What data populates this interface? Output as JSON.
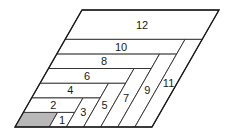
{
  "diagram": {
    "type": "nested-L parallelogram tiling",
    "geometry": {
      "origin_x": 15,
      "origin_y": 127,
      "col_width": 17.125,
      "row_height": 14.625,
      "shear": 0.5726,
      "cols": 8,
      "rows": 8
    },
    "colors": {
      "shaded": "#b8b8b8",
      "stroke": "#2a2a2a",
      "background": "#ffffff"
    },
    "shaded_cell": {
      "c0": 0,
      "c1": 2,
      "r0": 0,
      "r1": 1
    },
    "pieces": [
      {
        "label": "1",
        "c0": 2,
        "c1": 3,
        "r0": 0,
        "r1": 1
      },
      {
        "label": "2",
        "c0": 0,
        "c1": 3,
        "r0": 1,
        "r1": 2
      },
      {
        "label": "3",
        "c0": 3,
        "c1": 4,
        "r0": 0,
        "r1": 2
      },
      {
        "label": "4",
        "c0": 0,
        "c1": 4,
        "r0": 2,
        "r1": 3
      },
      {
        "label": "5",
        "c0": 4,
        "c1": 5,
        "r0": 0,
        "r1": 3
      },
      {
        "label": "6",
        "c0": 0,
        "c1": 5,
        "r0": 3,
        "r1": 4
      },
      {
        "label": "7",
        "c0": 5,
        "c1": 6,
        "r0": 0,
        "r1": 4
      },
      {
        "label": "8",
        "c0": 0,
        "c1": 6,
        "r0": 4,
        "r1": 5
      },
      {
        "label": "9",
        "c0": 6,
        "c1": 7,
        "r0": 0,
        "r1": 5
      },
      {
        "label": "10",
        "c0": 0,
        "c1": 7,
        "r0": 5,
        "r1": 6
      },
      {
        "label": "11",
        "c0": 7,
        "c1": 8,
        "r0": 0,
        "r1": 6
      },
      {
        "label": "12",
        "c0": 0,
        "c1": 8,
        "r0": 6,
        "r1": 8
      }
    ]
  }
}
